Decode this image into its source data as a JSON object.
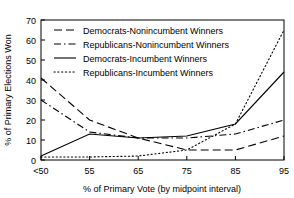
{
  "chart_data": {
    "type": "line",
    "title": "",
    "xlabel": "% of Primary Vote (by midpoint interval)",
    "ylabel": "% of Primary Elections Won",
    "x_tick_labels": [
      "<50",
      "55",
      "65",
      "75",
      "85",
      "95"
    ],
    "x_values": [
      50,
      55,
      65,
      75,
      85,
      95
    ],
    "y_tick_labels": [
      "0",
      "10",
      "20",
      "30",
      "40",
      "50",
      "60",
      "70"
    ],
    "ylim": [
      0,
      70
    ],
    "xlim": [
      50,
      95
    ],
    "grid": false,
    "legend_position": "top-left",
    "series": [
      {
        "name": "Democrats-Nonincumbent Winners",
        "style": "dashed",
        "values": [
          41,
          20,
          11,
          5,
          5,
          12
        ]
      },
      {
        "name": "Republicans-Nonincumbent Winners",
        "style": "dash-dot",
        "values": [
          30,
          14,
          11,
          11,
          13,
          20
        ]
      },
      {
        "name": "Democrats-Incumbent Winners",
        "style": "solid",
        "values": [
          2,
          13,
          11,
          12,
          18,
          44
        ]
      },
      {
        "name": "Republicans-Incumbent Winners",
        "style": "dotted",
        "values": [
          1.5,
          1.5,
          2,
          5,
          18,
          65
        ]
      }
    ]
  },
  "legend": {
    "items": [
      {
        "label": "Democrats-Nonincumbent Winners"
      },
      {
        "label": "Republicans-Nonincumbent Winners"
      },
      {
        "label": "Democrats-Incumbent Winners"
      },
      {
        "label": "Republicans-Incumbent Winners"
      }
    ]
  },
  "colors": {
    "ink": "#000000",
    "background": "#ffffff"
  }
}
